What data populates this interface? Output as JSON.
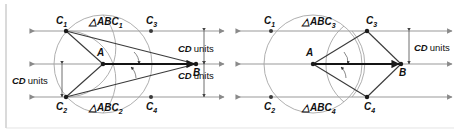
{
  "figure": {
    "type": "geometry-diagram",
    "colors": {
      "line": "#888888",
      "construction": "#555555",
      "segment": "#222222",
      "circle": "#999999",
      "border": "#aaaaaa",
      "text": "#111111"
    }
  },
  "left_panel": {
    "points": {
      "A": "A",
      "B": "B",
      "C1": "C",
      "C1_sub": "1",
      "C2": "C",
      "C2_sub": "2",
      "C3": "C",
      "C3_sub": "3",
      "C4": "C",
      "C4_sub": "4"
    },
    "triangle_labels": [
      {
        "tri": "△",
        "name": "ABC",
        "sub": "1"
      },
      {
        "tri": "△",
        "name": "ABC",
        "sub": "2"
      }
    ],
    "measures": [
      {
        "id": "left-cd",
        "text": "CD",
        "unit": "units"
      },
      {
        "id": "right-cd-top",
        "text": "CD",
        "unit": "units"
      },
      {
        "id": "right-cd-bottom",
        "text": "CD",
        "unit": "units"
      }
    ]
  },
  "right_panel": {
    "points": {
      "A": "A",
      "B": "B",
      "C1": "C",
      "C1_sub": "1",
      "C2": "C",
      "C2_sub": "2",
      "C3": "C",
      "C3_sub": "3",
      "C4": "C",
      "C4_sub": "4"
    },
    "triangle_labels": [
      {
        "tri": "△",
        "name": "ABC",
        "sub": "3"
      },
      {
        "tri": "△",
        "name": "ABC",
        "sub": "4"
      }
    ],
    "measures": [
      {
        "id": "right-cd",
        "text": "CD",
        "unit": "units"
      }
    ]
  }
}
